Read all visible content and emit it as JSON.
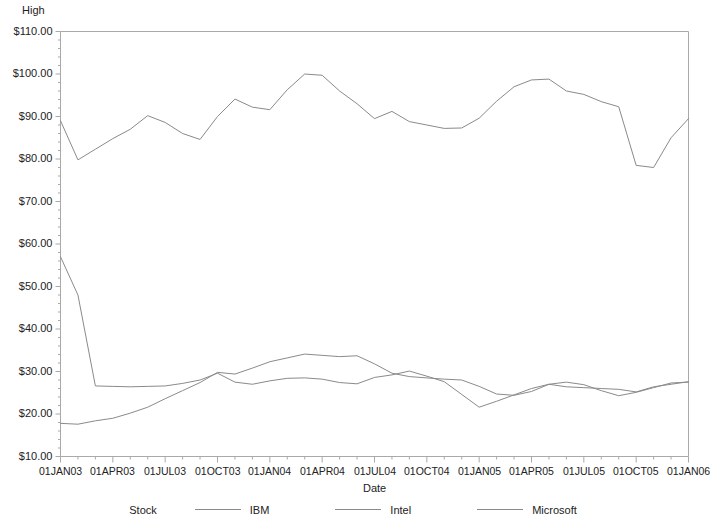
{
  "chart_data": {
    "type": "line",
    "title": "",
    "ylabel": "High",
    "xlabel": "Date",
    "ylim": [
      10,
      110
    ],
    "ytick_labels": [
      "$110.00",
      "$100.00",
      "$90.00",
      "$80.00",
      "$70.00",
      "$60.00",
      "$50.00",
      "$40.00",
      "$30.00",
      "$20.00",
      "$10.00"
    ],
    "ytick_values": [
      110,
      100,
      90,
      80,
      70,
      60,
      50,
      40,
      30,
      20,
      10
    ],
    "xlim": [
      "01JAN03",
      "01JAN06"
    ],
    "xtick_labels": [
      "01JAN03",
      "01APR03",
      "01JUL03",
      "01OCT03",
      "01JAN04",
      "01APR04",
      "01JUL04",
      "01OCT04",
      "01JAN05",
      "01APR05",
      "01JUL05",
      "01OCT05",
      "01JAN06"
    ],
    "xtick_values": [
      0,
      3,
      6,
      9,
      12,
      15,
      18,
      21,
      24,
      27,
      30,
      33,
      36
    ],
    "x_minor_ticks_per_interval": 3,
    "grid": false,
    "legend_position": "bottom",
    "legend_title": "Stock",
    "line_color": "#8a8a8a",
    "series": [
      {
        "name": "IBM",
        "x": [
          0,
          1,
          2,
          3,
          4,
          5,
          6,
          7,
          8,
          9,
          10,
          11,
          12,
          13,
          14,
          15,
          16,
          17,
          18,
          19,
          20,
          21,
          22,
          23,
          24,
          25,
          26,
          27,
          28,
          29,
          30,
          31,
          32,
          33,
          34,
          35,
          36
        ],
        "values": [
          89.0,
          79.8,
          82.3,
          84.8,
          87.0,
          90.2,
          88.6,
          86.0,
          84.6,
          90.0,
          94.1,
          92.2,
          91.6,
          96.3,
          100.0,
          99.7,
          96.0,
          93.0,
          89.5,
          91.2,
          88.8,
          88.0,
          87.2,
          87.3,
          89.6,
          93.6,
          97.0,
          98.6,
          98.8,
          96.0,
          95.2,
          93.5,
          92.3,
          78.5,
          78.0,
          85.0,
          89.5
        ]
      },
      {
        "name": "Intel",
        "x": [
          0,
          1,
          2,
          3,
          4,
          5,
          6,
          7,
          8,
          9,
          10,
          11,
          12,
          13,
          14,
          15,
          16,
          17,
          18,
          19,
          20,
          21,
          22,
          23,
          24,
          25,
          26,
          27,
          28,
          29,
          30,
          31,
          32,
          33,
          34,
          35,
          36
        ],
        "values": [
          17.8,
          17.6,
          18.4,
          19.0,
          20.2,
          21.6,
          23.6,
          25.5,
          27.4,
          29.8,
          29.4,
          30.8,
          32.3,
          33.2,
          34.1,
          33.8,
          33.5,
          33.7,
          31.8,
          29.6,
          28.8,
          28.5,
          28.2,
          28.0,
          26.5,
          24.7,
          24.4,
          25.3,
          27.0,
          27.5,
          26.9,
          25.5,
          24.3,
          25.1,
          26.2,
          27.3,
          27.5
        ]
      },
      {
        "name": "Microsoft",
        "x": [
          0,
          1,
          2,
          3,
          4,
          5,
          6,
          7,
          8,
          9,
          10,
          11,
          12,
          13,
          14,
          15,
          16,
          17,
          18,
          19,
          20,
          21,
          22,
          23,
          24,
          25,
          26,
          27,
          28,
          29,
          30,
          31,
          32,
          33,
          34,
          35,
          36
        ],
        "values": [
          57.0,
          48.0,
          26.6,
          26.5,
          26.4,
          26.5,
          26.6,
          27.2,
          28.0,
          29.6,
          27.5,
          27.0,
          27.8,
          28.4,
          28.5,
          28.2,
          27.4,
          27.1,
          28.6,
          29.2,
          30.1,
          28.9,
          27.6,
          24.6,
          21.6,
          23.0,
          24.5,
          26.0,
          27.0,
          26.4,
          26.2,
          26.0,
          25.8,
          25.2,
          26.4,
          27.0,
          27.6
        ]
      }
    ]
  },
  "legend": {
    "title": "Stock",
    "entries": [
      {
        "label": "IBM"
      },
      {
        "label": "Intel"
      },
      {
        "label": "Microsoft"
      }
    ]
  }
}
